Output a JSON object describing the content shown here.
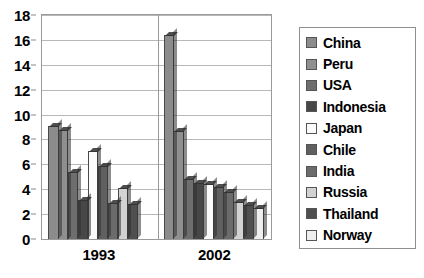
{
  "chart_data": {
    "type": "bar",
    "title": "",
    "subtitle": "",
    "xlabel": "",
    "ylabel": "",
    "categories": [
      "1993",
      "2002"
    ],
    "ylim": [
      0,
      18
    ],
    "yticks": [
      0,
      2,
      4,
      6,
      8,
      10,
      12,
      14,
      16,
      18
    ],
    "grid": true,
    "legend_position": "right",
    "series": [
      {
        "name": "China",
        "color": "#8c8c8c",
        "values": [
          9.1,
          16.4
        ]
      },
      {
        "name": "Peru",
        "color": "#8f8f8f",
        "values": [
          8.8,
          8.7
        ]
      },
      {
        "name": "USA",
        "color": "#6e6e6e",
        "values": [
          5.4,
          4.8
        ]
      },
      {
        "name": "Indonesia",
        "color": "#474747",
        "values": [
          3.1,
          4.5
        ]
      },
      {
        "name": "Japan",
        "color": "#fbfbfb",
        "values": [
          7.1,
          4.4
        ]
      },
      {
        "name": "Chile",
        "color": "#606060",
        "values": [
          5.9,
          4.2
        ]
      },
      {
        "name": "India",
        "color": "#6b6b6b",
        "values": [
          2.9,
          3.8
        ]
      },
      {
        "name": "Russia",
        "color": "#d2d2d2",
        "values": [
          4.1,
          3.0
        ]
      },
      {
        "name": "Thailand",
        "color": "#4f4f4f",
        "values": [
          2.8,
          2.7
        ]
      },
      {
        "name": "Norway",
        "color": "#eeeeee",
        "values": [
          0.0,
          2.5
        ]
      }
    ]
  },
  "axis": {
    "y_tick_labels": [
      "18",
      "16",
      "14",
      "12",
      "10",
      "8",
      "6",
      "4",
      "2",
      "0"
    ],
    "x_tick_labels": [
      "1993",
      "2002"
    ]
  },
  "legend": {
    "items": [
      {
        "label": "China"
      },
      {
        "label": "Peru"
      },
      {
        "label": "USA"
      },
      {
        "label": "Indonesia"
      },
      {
        "label": "Japan"
      },
      {
        "label": "Chile"
      },
      {
        "label": "India"
      },
      {
        "label": "Russia"
      },
      {
        "label": "Thailand"
      },
      {
        "label": "Norway"
      }
    ]
  }
}
